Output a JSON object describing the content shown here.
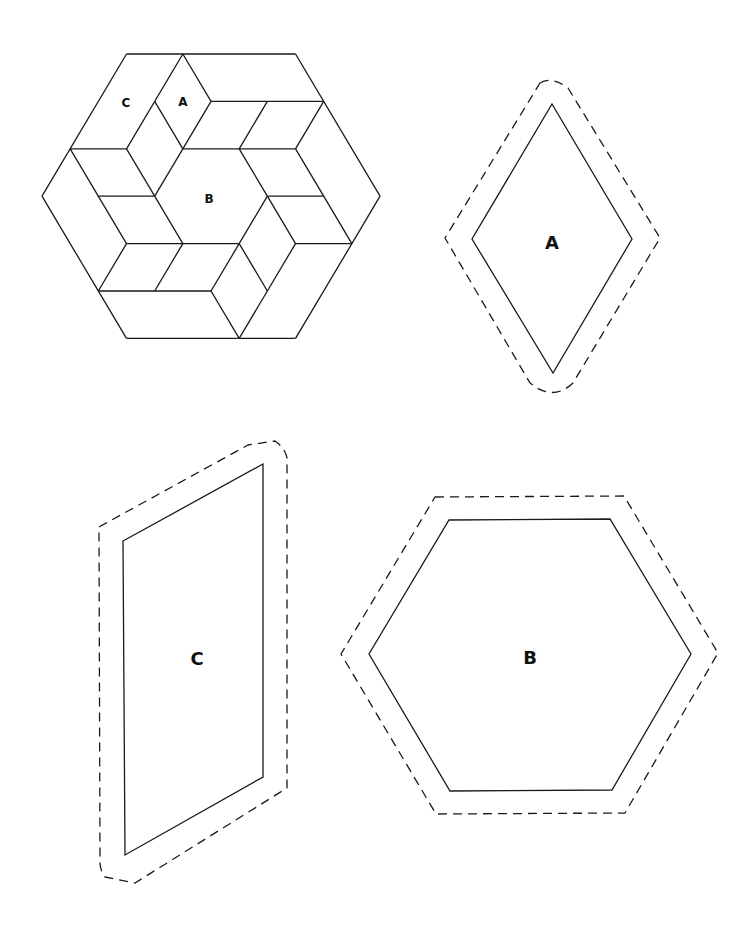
{
  "quilt_block": {
    "labels": [
      {
        "text": "C",
        "x": 126,
        "y": 103
      },
      {
        "text": "A",
        "x": 183,
        "y": 102
      },
      {
        "text": "B",
        "x": 209,
        "y": 199
      }
    ]
  },
  "templates": {
    "A": {
      "label": "A",
      "shape": "diamond"
    },
    "B": {
      "label": "B",
      "shape": "hexagon"
    },
    "C": {
      "label": "C",
      "shape": "parallelogram"
    }
  },
  "legend": {
    "solid_line": "finished sewing line",
    "dashed_line": "seam allowance cutting line"
  },
  "colors": {
    "stroke": "#1a1a1a",
    "background": "#ffffff"
  }
}
